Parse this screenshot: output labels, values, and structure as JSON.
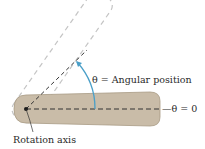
{
  "diagram": {
    "labels": {
      "angular_position": "θ = Angular position",
      "zero_angle": "θ = 0",
      "rotation_axis": "Rotation axis"
    },
    "colors": {
      "bar_fill": "#c9bca8",
      "bar_stroke": "#a89a84",
      "ghost_outline": "#c4c4c4",
      "dashed_line": "#333333",
      "arc": "#4a9fc8",
      "pivot": "#1a1a1a",
      "text": "#2a2a2a"
    },
    "rotation_angle_deg": 55
  }
}
